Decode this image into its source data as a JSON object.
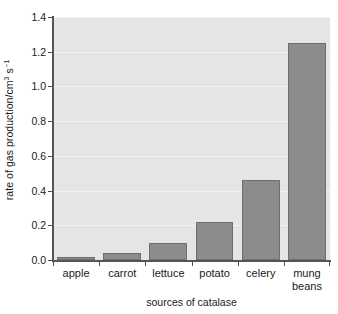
{
  "chart_data": {
    "type": "bar",
    "title": "",
    "subtitle": "",
    "xlabel": "sources of catalase",
    "ylabel": "rate of gas production/cm3 s-1",
    "ylabel_parts": {
      "base": "rate of gas production/cm",
      "sup1": "3",
      "mid": " s",
      "sup2": "−1"
    },
    "categories": [
      "apple",
      "carrot",
      "lettuce",
      "potato",
      "celery",
      "mung beans"
    ],
    "category_lines": [
      [
        "apple"
      ],
      [
        "carrot"
      ],
      [
        "lettuce"
      ],
      [
        "potato"
      ],
      [
        "celery"
      ],
      [
        "mung",
        "beans"
      ]
    ],
    "values": [
      0.02,
      0.04,
      0.1,
      0.22,
      0.46,
      1.25
    ],
    "ylim": [
      0.0,
      1.4
    ],
    "ytick_values": [
      0.0,
      0.2,
      0.4,
      0.6,
      0.8,
      1.0,
      1.2,
      1.4
    ],
    "ytick_labels": [
      "0.0",
      "0.2",
      "0.4",
      "0.6",
      "0.8",
      "1.0",
      "1.2",
      "1.4"
    ],
    "grid": true,
    "grid_axis": "y",
    "legend": false,
    "legend_position": "none",
    "bar_color": "#8c8c8c",
    "bar_edge_color": "#6e6e6e",
    "plot_background": "#e5e5e5",
    "gridline_color": "#f4f4f4",
    "axis_color": "#555555",
    "text_color": "#1a1a1a",
    "figure_background": "#ffffff"
  }
}
